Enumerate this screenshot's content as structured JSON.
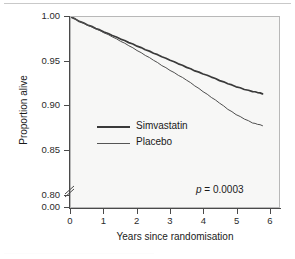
{
  "chart_data": {
    "type": "line",
    "title": "",
    "subtitle": "",
    "xlabel": "Years since randomisation",
    "ylabel": "Proportion alive",
    "xlim": [
      0,
      6.3
    ],
    "ylim": [
      0.785,
      1.0
    ],
    "grid": false,
    "legend_position": "center-left-inside",
    "x_ticks": [
      "0",
      "1",
      "2",
      "3",
      "4",
      "5",
      "6"
    ],
    "x_tick_values": [
      0,
      1,
      2,
      3,
      4,
      5,
      6
    ],
    "y_ticks": [
      "1.00",
      "0.95",
      "0.90",
      "0.85",
      "0.80",
      "0.00"
    ],
    "y_tick_values": [
      1.0,
      0.95,
      0.9,
      0.85,
      0.8,
      0.0
    ],
    "y_axis_break": true,
    "y_axis_break_between": [
      0.8,
      0.0
    ],
    "annotations": [
      {
        "name": "p-value",
        "text_italic": "p",
        "text": " = 0.0003",
        "x": 5.0,
        "y": 0.805
      }
    ],
    "series": [
      {
        "name": "Simvastatin",
        "style": "thick",
        "color": "#3a3a3a",
        "x": [
          0,
          0.25,
          0.5,
          0.75,
          1.0,
          1.25,
          1.5,
          1.75,
          2.0,
          2.25,
          2.5,
          2.75,
          3.0,
          3.25,
          3.5,
          3.75,
          4.0,
          4.25,
          4.5,
          4.75,
          5.0,
          5.25,
          5.5,
          5.65,
          5.8
        ],
        "y": [
          1.0,
          0.995,
          0.991,
          0.987,
          0.983,
          0.979,
          0.975,
          0.971,
          0.967,
          0.963,
          0.959,
          0.955,
          0.951,
          0.947,
          0.943,
          0.939,
          0.9355,
          0.932,
          0.928,
          0.9245,
          0.921,
          0.918,
          0.9155,
          0.9145,
          0.913
        ]
      },
      {
        "name": "Placebo",
        "style": "thin",
        "color": "#4f4f4f",
        "x": [
          0,
          0.25,
          0.5,
          0.75,
          1.0,
          1.25,
          1.5,
          1.75,
          2.0,
          2.25,
          2.5,
          2.75,
          3.0,
          3.25,
          3.5,
          3.75,
          4.0,
          4.25,
          4.5,
          4.75,
          5.0,
          5.25,
          5.5,
          5.65,
          5.8
        ],
        "y": [
          1.0,
          0.995,
          0.9905,
          0.9865,
          0.982,
          0.9775,
          0.9725,
          0.9675,
          0.962,
          0.9565,
          0.951,
          0.945,
          0.9395,
          0.934,
          0.9285,
          0.922,
          0.9155,
          0.909,
          0.9025,
          0.8955,
          0.8895,
          0.8845,
          0.88,
          0.8785,
          0.877
        ]
      }
    ]
  },
  "figure": {
    "legend": [
      {
        "label": "Simvastatin",
        "style": "thick"
      },
      {
        "label": "Placebo",
        "style": "thin"
      }
    ],
    "pvalue_italic": "p",
    "pvalue_rest": " = 0.0003"
  },
  "colors": {
    "plot_background": "#f7f7f6",
    "frame": "#b8b8b8",
    "axis": "#4a4a4a",
    "text": "#1a1a1a",
    "series_thick": "#3a3a3a",
    "series_thin": "#4f4f4f"
  }
}
